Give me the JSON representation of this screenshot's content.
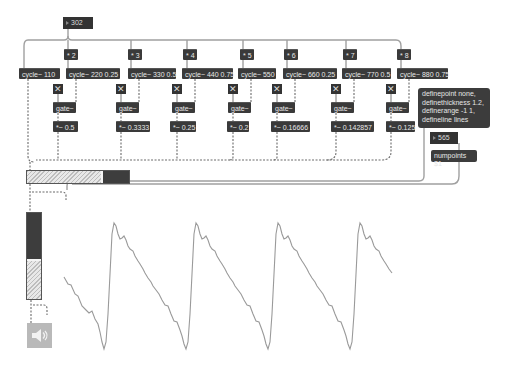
{
  "patch": {
    "fundamental_number": "302",
    "harmonics": [
      {
        "mult": "* 2",
        "cycle": "cycle~ 220 0.25",
        "gate": "gate~",
        "gain": "*~ 0.5"
      },
      {
        "mult": "* 3",
        "cycle": "cycle~ 330 0.5",
        "gate": "gate~",
        "gain": "*~ 0.3333"
      },
      {
        "mult": "* 4",
        "cycle": "cycle~ 440 0.75",
        "gate": "gate~",
        "gain": "*~ 0.25"
      },
      {
        "mult": "* 5",
        "cycle": "cycle~ 550",
        "gate": "gate~",
        "gain": "*~ 0.2"
      },
      {
        "mult": "* 6",
        "cycle": "cycle~ 660 0.25",
        "gate": "gate~",
        "gain": "*~ 0.16666"
      },
      {
        "mult": "* 7",
        "cycle": "cycle~ 770 0.5",
        "gate": "gate~",
        "gain": "*~ 0.142857"
      },
      {
        "mult": "* 8",
        "cycle": "cycle~ 880 0.75",
        "gate": "gate~",
        "gain": "*~ 0.125"
      }
    ],
    "base_cycle": "cycle~ 110",
    "toggle_glyph": "✕",
    "scope_message": [
      "definepoint none,",
      "definethickness 1.2,",
      "definerange -1 1,",
      "defineline lines"
    ],
    "numpoints_number": "565",
    "numpoints_message": "numpoints $1",
    "hslider_fill_pct": 72,
    "vslider_fill_pct": 43,
    "dac_icon": "speaker-icon"
  },
  "colors": {
    "object_bg": "#3a3a3a",
    "object_text": "#e8e8e8",
    "cord": "#9a9a9a",
    "signal_cord": "#6a6a6a",
    "scope_line": "#9a9a9a",
    "dac_bg": "#b9b9b9"
  }
}
